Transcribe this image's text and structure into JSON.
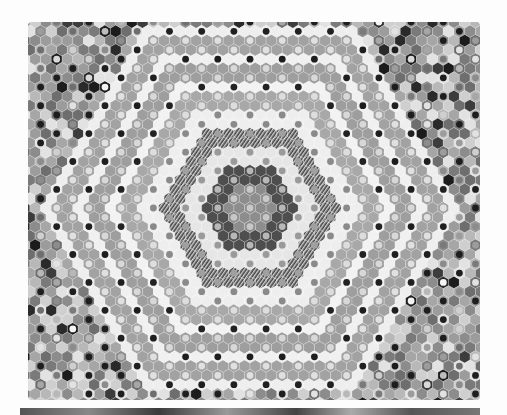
{
  "image": {
    "subject": "Grayscale photograph of a hand-pieced hexagon (grandmother's flower garden) quilt with a central concentric hexagonal medallion",
    "width": 507,
    "height": 415,
    "background": "#fdfdfd"
  },
  "quilt": {
    "bounds": {
      "x": 28,
      "y": 22,
      "width": 452,
      "height": 378
    },
    "center": {
      "x": 250,
      "y": 208
    },
    "hex_size": 6.2,
    "base_tone": "#9a9a9a",
    "rings": [
      {
        "name": "center-field",
        "from": 0,
        "to": 2,
        "fill": "#8d8d8d",
        "dot": "#c8c8c8"
      },
      {
        "name": "dark-ring",
        "from": 3,
        "to": 4,
        "fill": "#4e4e4e",
        "dot": "#b8b8b8"
      },
      {
        "name": "white-ring-1",
        "from": 5,
        "to": 6,
        "fill": "#e6e6e6",
        "dot": "#9a9a9a"
      },
      {
        "name": "striped-ring",
        "from": 7,
        "to": 8,
        "fill": "#5a5a5a",
        "dot": "#a0a0a0",
        "striped": true
      },
      {
        "name": "white-ring-2",
        "from": 9,
        "to": 10,
        "fill": "#eeeeee",
        "dot": "#8a8a8a"
      },
      {
        "name": "gray-ring-1",
        "from": 11,
        "to": 12,
        "fill": "#a8a8a8",
        "dot": "#dddddd"
      },
      {
        "name": "white-dot-ring-1",
        "from": 13,
        "to": 13,
        "fill": "#f2f2f2",
        "dot": "#222222"
      },
      {
        "name": "gray-ring-2",
        "from": 14,
        "to": 15,
        "fill": "#9e9e9e",
        "dot": "#d8d8d8"
      },
      {
        "name": "white-dot-ring-2",
        "from": 16,
        "to": 16,
        "fill": "#f0f0f0",
        "dot": "#1e1e1e"
      },
      {
        "name": "gray-ring-3",
        "from": 17,
        "to": 18,
        "fill": "#a2a2a2",
        "dot": "#e0e0e0"
      },
      {
        "name": "white-dot-ring-3",
        "from": 19,
        "to": 19,
        "fill": "#eeeeee",
        "dot": "#202020"
      },
      {
        "name": "outer-field",
        "from": 20,
        "to": 60,
        "fill": "mixed",
        "dot": "mixed"
      }
    ],
    "outer_palette": [
      "#8c8c8c",
      "#a6a6a6",
      "#b8b8b8",
      "#cfcfcf",
      "#7a7a7a",
      "#e2e2e2",
      "#9c9c9c",
      "#6e6e6e"
    ],
    "flower_dark": [
      "#2a2a2a",
      "#3c3c3c",
      "#1c1c1c"
    ],
    "flower_center": [
      "#d8d8d8",
      "#f4f4f4",
      "#bdbdbd"
    ]
  }
}
